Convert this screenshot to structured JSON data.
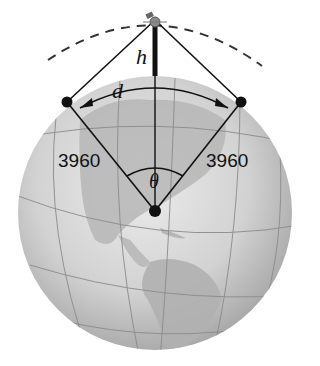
{
  "diagram": {
    "type": "geometry",
    "labels": {
      "height": "h",
      "arc": "d",
      "angle": "θ",
      "radius_left": "3960",
      "radius_right": "3960"
    },
    "colors": {
      "globe_light": "#e6e6e6",
      "globe_dark": "#9a9a9a",
      "land": "#b4b4b4",
      "lines": "#111111",
      "background": "#ffffff"
    }
  }
}
